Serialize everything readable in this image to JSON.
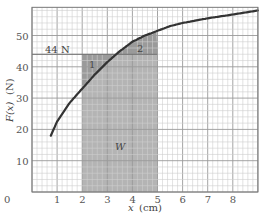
{
  "chart_data": {
    "type": "line",
    "title": "",
    "xlabel": "x (cm)",
    "ylabel": "F(x) (N)",
    "xlim": [
      0,
      9
    ],
    "ylim": [
      0,
      59
    ],
    "grid": true,
    "x_ticks": [
      0,
      1,
      2,
      3,
      4,
      5,
      6,
      7,
      8
    ],
    "y_ticks": [
      10,
      20,
      30,
      40,
      50
    ],
    "series": [
      {
        "name": "F(x)",
        "x": [
          0.75,
          1.0,
          1.5,
          2.0,
          2.5,
          3.0,
          3.5,
          4.0,
          4.5,
          5.0,
          5.5,
          6.0,
          7.0,
          8.0,
          9.0
        ],
        "values": [
          18,
          22.5,
          28.5,
          33,
          37.5,
          41.5,
          45,
          48,
          50,
          51.5,
          53,
          54,
          55.5,
          56.7,
          58
        ]
      }
    ],
    "annotations": {
      "reference_line": {
        "label": "44 N",
        "value": 44
      },
      "shaded_region": {
        "label": "W",
        "x_from": 2,
        "x_to": 5,
        "y_from": 0,
        "y_to": 44
      },
      "region_1_label": "1",
      "region_2_label": "2"
    },
    "colors": {
      "curve": "#333333",
      "shade": "#b4b4b4",
      "shade_dark": "#9a9a9a",
      "grid_minor": "#cfcfcf",
      "grid_major": "#9a9a9a"
    }
  },
  "labels": {
    "x_axis": "x",
    "x_unit": "(cm)",
    "y_axis": "F(x)",
    "y_unit": "(N)",
    "ref_line": "44 N",
    "region1": "1",
    "region2": "2",
    "work": "W",
    "origin": "0"
  }
}
